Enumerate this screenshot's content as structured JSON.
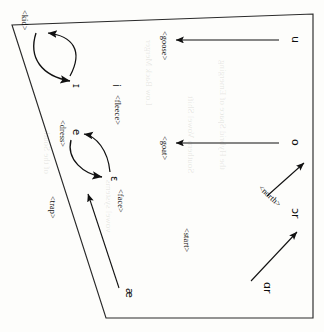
{
  "figure": {
    "type": "vowel-space-diagram",
    "orientation_deg": 90,
    "ink_color": "#111111",
    "paper_color": "#fdfdfb",
    "frame": {
      "name": "vowel-quadrilateral"
    }
  },
  "vowels": [
    {
      "id": "u",
      "symbol": "u",
      "x": 40,
      "y": 30,
      "set": null
    },
    {
      "id": "o",
      "symbol": "o",
      "x": 143,
      "y": 30,
      "set": null
    },
    {
      "id": "or",
      "symbol": "ɔr",
      "x": 214,
      "y": 30,
      "set": "<north>"
    },
    {
      "id": "ar",
      "symbol": "ɑr",
      "x": 286,
      "y": 58,
      "set": null
    },
    {
      "id": "kit",
      "symbol": "ɪ",
      "x": 86,
      "y": 248,
      "set": "<kid>"
    },
    {
      "id": "fleece",
      "symbol": "i",
      "x": 86,
      "y": 207,
      "set": "<fleece>"
    },
    {
      "id": "dress",
      "symbol": "e",
      "x": 143,
      "y": 248,
      "set": "<dress>"
    },
    {
      "id": "face",
      "symbol": "ɛ",
      "x": 182,
      "y": 207,
      "set": "<face>"
    },
    {
      "id": "trap",
      "symbol": "æ",
      "x": 292,
      "y": 196,
      "set": "<trap>"
    }
  ],
  "labels": {
    "goose": "<goose>",
    "goat": "<goat>",
    "north": "<north>",
    "start": "<start>",
    "kid": "<kid>",
    "fleece": "<fleece>",
    "dress": "<dress>",
    "face": "<face>",
    "trap": "<trap>"
  },
  "symbols": {
    "u": "u",
    "o": "o",
    "or": "ɔr",
    "ar": "ɑr",
    "kit": "ɪ",
    "i": "i",
    "e": "e",
    "eps": "ɛ",
    "ash": "æ"
  },
  "arrows": [
    {
      "id": "goose-fronting",
      "style": "straight",
      "label": "<goose>",
      "from": "u",
      "to": "<goose>"
    },
    {
      "id": "goat-fronting",
      "style": "straight",
      "label": "<goat>",
      "from": "o",
      "to": "<goat>"
    },
    {
      "id": "north-raising",
      "style": "straight",
      "label": "<north>",
      "from": "<north>",
      "to": "ɔr"
    },
    {
      "id": "start-backing",
      "style": "straight",
      "label": "<start>",
      "from": "ɑr",
      "to": "ɔr"
    },
    {
      "id": "kit-lowering",
      "style": "curved",
      "label": "<kid>",
      "from": "ɪ",
      "to": "<kid>"
    },
    {
      "id": "fleece-raising",
      "style": "curved",
      "label": "<fleece>",
      "from": "<kid>",
      "to": "i"
    },
    {
      "id": "dress-lowering",
      "style": "curved",
      "label": "<dress>",
      "from": "ɛ",
      "to": "e"
    },
    {
      "id": "face-raising",
      "style": "curved",
      "label": "<face>",
      "from": "e",
      "to": "ɛ"
    },
    {
      "id": "trap-fronting",
      "style": "straight",
      "label": "<trap>",
      "from": "æ",
      "to": "ɛ"
    }
  ],
  "bleedthrough": [
    "the Hybrid Space of Emerging",
    "Southern Vowel Shift",
    "Low Back Merger",
    "vowel systems",
    "of the South"
  ]
}
